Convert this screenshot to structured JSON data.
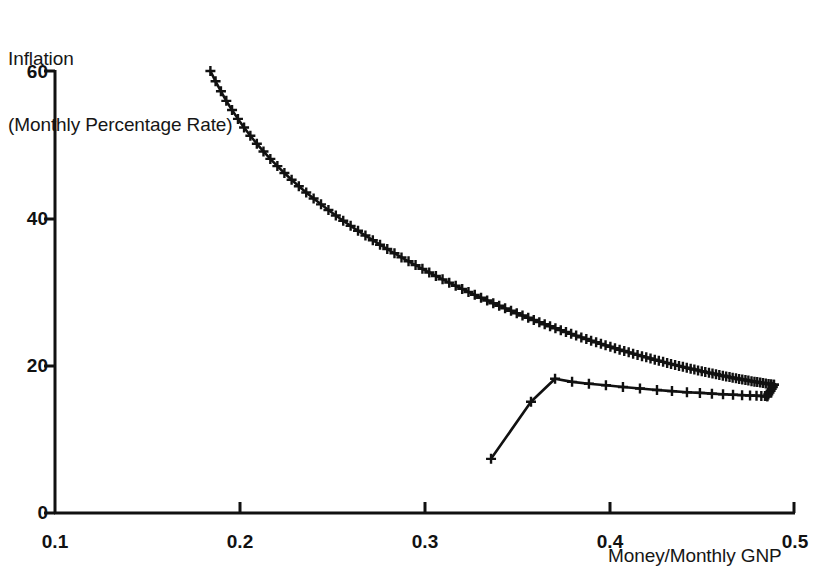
{
  "chart_data": {
    "type": "line",
    "title": "",
    "ylabel": "Inflation\n(Monthly Percentage Rate)",
    "ylabel_line1": "Inflation",
    "ylabel_line2": "(Monthly Percentage Rate)",
    "xlabel": "Money/Monthly GNP",
    "xlim": [
      0.1,
      0.5
    ],
    "ylim": [
      0,
      60
    ],
    "xticks": [
      0.1,
      0.2,
      0.3,
      0.4,
      0.5
    ],
    "xtick_labels": [
      "0.1",
      "0.2",
      "0.3",
      "0.4",
      "0.5"
    ],
    "yticks": [
      0,
      20,
      40,
      60
    ],
    "ytick_labels": [
      "0",
      "20",
      "40",
      "60"
    ],
    "grid": false,
    "legend": "none",
    "marker": "plus",
    "line_color": "#111111",
    "series": [
      {
        "name": "upper-branch",
        "x": [
          0.184,
          0.1868,
          0.1897,
          0.1926,
          0.1957,
          0.1989,
          0.2022,
          0.2056,
          0.2091,
          0.2127,
          0.2164,
          0.2202,
          0.224,
          0.2279,
          0.2318,
          0.2358,
          0.2398,
          0.2438,
          0.2478,
          0.2518,
          0.2558,
          0.2598,
          0.2638,
          0.2678,
          0.2718,
          0.2757,
          0.2796,
          0.2835,
          0.2873,
          0.2911,
          0.2949,
          0.2986,
          0.3023,
          0.3059,
          0.3095,
          0.3131,
          0.3166,
          0.3201,
          0.3235,
          0.3269,
          0.3303,
          0.3336,
          0.3369,
          0.3401,
          0.3433,
          0.3465,
          0.3496,
          0.3527,
          0.3558,
          0.3588,
          0.3618,
          0.3647,
          0.3676,
          0.3705,
          0.3734,
          0.3762,
          0.379,
          0.3817,
          0.3845,
          0.3872,
          0.3898,
          0.3925,
          0.3951,
          0.3976,
          0.4002,
          0.4027,
          0.4052,
          0.4077,
          0.4101,
          0.4125,
          0.4149,
          0.4173,
          0.4196,
          0.4219,
          0.4242,
          0.4264,
          0.4287,
          0.4309,
          0.433,
          0.4352,
          0.4373,
          0.4394,
          0.4415,
          0.4436,
          0.4456,
          0.4476,
          0.4496,
          0.4515,
          0.4535,
          0.4554,
          0.4573,
          0.4591,
          0.461,
          0.4628,
          0.4646,
          0.4663,
          0.4681,
          0.4698,
          0.4715,
          0.4732,
          0.4748,
          0.4765,
          0.4781,
          0.4796,
          0.4812,
          0.4827,
          0.4842,
          0.4857,
          0.4871,
          0.4886
        ],
        "y": [
          60.0,
          58.6,
          57.25,
          55.95,
          54.7,
          53.5,
          52.33,
          51.21,
          50.12,
          49.08,
          48.07,
          47.09,
          46.15,
          45.24,
          44.36,
          43.51,
          42.69,
          41.9,
          41.13,
          40.39,
          39.67,
          38.98,
          38.31,
          37.66,
          37.03,
          36.42,
          35.83,
          35.26,
          34.7,
          34.17,
          33.65,
          33.14,
          32.65,
          32.18,
          31.72,
          31.27,
          30.84,
          30.42,
          30.01,
          29.61,
          29.22,
          28.85,
          28.48,
          28.13,
          27.78,
          27.45,
          27.12,
          26.8,
          26.5,
          26.2,
          25.91,
          25.62,
          25.35,
          25.08,
          24.82,
          24.56,
          24.32,
          24.08,
          23.84,
          23.61,
          23.39,
          23.17,
          22.96,
          22.76,
          22.56,
          22.36,
          22.17,
          21.99,
          21.81,
          21.63,
          21.46,
          21.29,
          21.13,
          20.97,
          20.81,
          20.66,
          20.52,
          20.37,
          20.23,
          20.1,
          19.97,
          19.84,
          19.71,
          19.59,
          19.47,
          19.36,
          19.24,
          19.14,
          19.03,
          18.93,
          18.83,
          18.73,
          18.63,
          18.54,
          18.45,
          18.37,
          18.28,
          18.2,
          18.12,
          18.05,
          17.97,
          17.9,
          17.83,
          17.77,
          17.7,
          17.64,
          17.58,
          17.52,
          17.47,
          17.41
        ]
      },
      {
        "name": "upper-branch-tail",
        "x": [
          0.4886,
          0.488,
          0.4874,
          0.4868,
          0.4862,
          0.4856,
          0.485
        ],
        "y": [
          17.41,
          17.1,
          16.85,
          16.6,
          16.35,
          16.1,
          15.85
        ]
      },
      {
        "name": "lower-branch",
        "x": [
          0.3357,
          0.3573,
          0.3703,
          0.3795,
          0.3886,
          0.3978,
          0.407,
          0.4162,
          0.4254,
          0.4335,
          0.4416,
          0.4486,
          0.4551,
          0.4611,
          0.4665,
          0.4714,
          0.4757,
          0.4792,
          0.4818,
          0.4838,
          0.485
        ],
        "y": [
          7.35,
          15.1,
          18.23,
          17.8,
          17.55,
          17.35,
          17.1,
          16.9,
          16.7,
          16.55,
          16.4,
          16.3,
          16.2,
          16.12,
          16.05,
          16.0,
          15.95,
          15.92,
          15.89,
          15.87,
          15.85
        ]
      }
    ]
  },
  "figure": {
    "background_color": "#ffffff",
    "axis_color": "#111111"
  }
}
